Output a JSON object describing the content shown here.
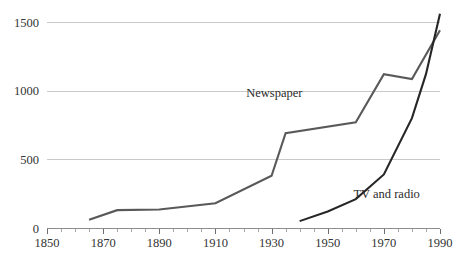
{
  "chart_data": {
    "type": "line",
    "title": "",
    "xlabel": "",
    "ylabel": "",
    "xlim": [
      1850,
      1990
    ],
    "ylim": [
      0,
      1500
    ],
    "grid": true,
    "gridlines_y": [
      500,
      1000,
      1500
    ],
    "legend_position": "inline-annotation",
    "y_ticks": [
      "0",
      "500",
      "1000",
      "1500"
    ],
    "y_tick_values": [
      0,
      500,
      1000,
      1500
    ],
    "x_ticks": [
      "1850",
      "1870",
      "1890",
      "1910",
      "1930",
      "1950",
      "1970",
      "1990"
    ],
    "x_tick_values": [
      1850,
      1870,
      1890,
      1910,
      1930,
      1950,
      1970,
      1990
    ],
    "x_minor_tick_values": [
      1855,
      1860,
      1865,
      1875,
      1880,
      1885,
      1895,
      1900,
      1905,
      1915,
      1920,
      1925,
      1935,
      1940,
      1945,
      1955,
      1960,
      1965,
      1975,
      1980,
      1985
    ],
    "series": [
      {
        "name": "Newspaper",
        "color": "#595959",
        "stroke_width": 2.1,
        "label_x": 1931,
        "label_y": 955,
        "x": [
          1865,
          1875,
          1890,
          1910,
          1930,
          1935,
          1960,
          1970,
          1980,
          1990
        ],
        "values": [
          60,
          130,
          135,
          180,
          380,
          690,
          770,
          1120,
          1085,
          1440
        ]
      },
      {
        "name": "TV and radio",
        "color": "#262626",
        "stroke_width": 2.1,
        "label_x": 1971,
        "label_y": 215,
        "x": [
          1940,
          1950,
          1960,
          1970,
          1980,
          1985,
          1990
        ],
        "values": [
          50,
          120,
          210,
          390,
          800,
          1120,
          1560
        ]
      }
    ]
  },
  "plot_area": {
    "left": 47,
    "right": 440,
    "top": 22,
    "bottom": 228
  },
  "colors": {
    "background": "#ffffff",
    "gridline": "#c9c9c9",
    "axis": "#8d8d8d",
    "text": "#333333"
  }
}
